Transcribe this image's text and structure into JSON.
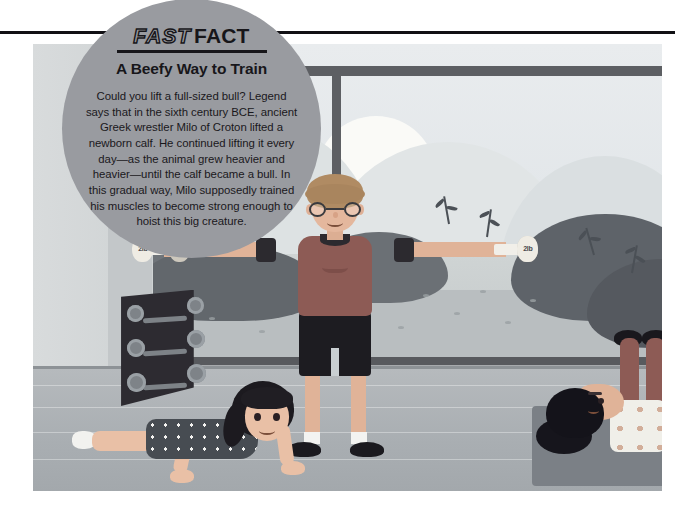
{
  "page": {
    "background_color": "#ffffff",
    "rule_color": "#111014"
  },
  "fact_callout": {
    "kicker_light": "FAST",
    "kicker_bold": "FACT",
    "title": "A Beefy Way to Train",
    "body": "Could you lift a full-sized bull? Legend says that in the sixth century BCE, ancient Greek wrestler Milo of Croton lifted a newborn calf. He continued lifting it every day—as the animal grew heavier and heavier—until the calf became a bull. In this gradual way, Milo supposedly trained his muscles to become strong enough to hoist this big creature.",
    "circle_color": "#999ba0",
    "text_color": "#17161a"
  },
  "illustration": {
    "scene_description": "Children exercising in a gym in front of a large window overlooking hills",
    "colors": {
      "floor": "#a9aeb2",
      "wall": "#d8dbdc",
      "window_frame": "#5d5f63",
      "sky": "#e9ecee",
      "bush": "#6f7479",
      "mat": "#7b8086"
    },
    "boy": {
      "label": "boy-lifting-dumbbells",
      "shirt_color": "#8d5b55",
      "shorts_color": "#1d1c21",
      "hair_color": "#b08b63",
      "left_dumbbell_label": "2lb",
      "right_dumbbell_label": "2lb"
    },
    "girl": {
      "label": "girl-doing-push-up",
      "shirt_color": "#474c52",
      "hair_color": "#1c1a1f"
    },
    "situp_person": {
      "label": "person-doing-sit-ups",
      "shirt_color": "#f0efe9",
      "shorts_color": "#8d5b55",
      "hair_color": "#14131a"
    },
    "rack": {
      "label": "dumbbell-rack",
      "color": "#2d2b31",
      "plate_count": 6
    }
  }
}
